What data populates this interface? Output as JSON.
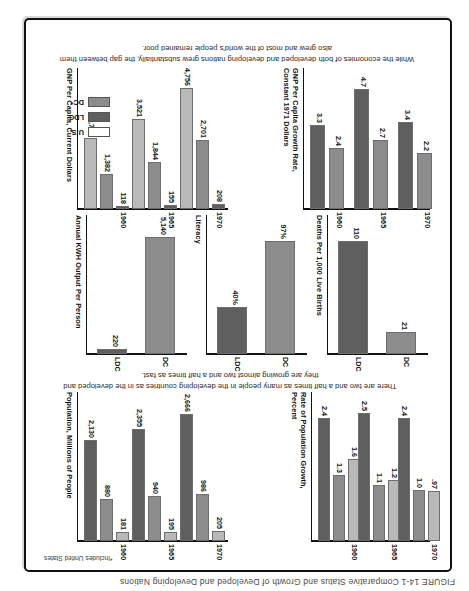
{
  "figure_caption": "FIGURE 14-1   Comparative Status and Growth of Developed and Developing Nations",
  "footnote": "*Includes United States",
  "captions": {
    "middle": "There are two and a half times as many people in the developing countries as in the developed and they are growing almost two and a half times as fast.",
    "bottom": "While the economies of both developed and developing nations grew substantially, the gap between them also grew and most of the world's people remained poor."
  },
  "legend": {
    "items": [
      {
        "label": "U.S.",
        "color": "#ffffff"
      },
      {
        "label": "LDC",
        "color": "#5f5f5f"
      },
      {
        "label": "DC*",
        "color": "#8c8c8c"
      }
    ]
  },
  "colors": {
    "ldc": "#5f5f5f",
    "dc": "#8c8c8c",
    "us": "#b9b9b9",
    "us_open": "#ffffff",
    "axis": "#111111"
  },
  "chart_data": [
    {
      "id": "rate-of-population-growth",
      "type": "bar",
      "title": "Rate of Population Growth, Percent",
      "ylabel": "Rate of Population Growth,\nPercent",
      "categories": [
        "1960",
        "1965",
        "1970"
      ],
      "series": [
        {
          "name": "LDC",
          "values": [
            2.4,
            2.5,
            2.4
          ],
          "labels": [
            "2.4",
            "2.5",
            "2.4"
          ]
        },
        {
          "name": "DC*",
          "values": [
            1.3,
            1.1,
            1.0
          ],
          "labels": [
            "1.3",
            "1.1",
            "1.0"
          ]
        },
        {
          "name": "U.S.",
          "values": [
            1.6,
            1.2,
            0.97
          ],
          "labels": [
            "1.6",
            "1.2",
            ".97"
          ]
        }
      ],
      "ylim": [
        0,
        2.7
      ]
    },
    {
      "id": "population-millions",
      "type": "bar",
      "title": "Population, Millions of People",
      "ylabel": "Population, Millions of People",
      "categories": [
        "1960",
        "1965",
        "1970"
      ],
      "series": [
        {
          "name": "LDC",
          "values": [
            2130,
            2355,
            2666
          ],
          "labels": [
            "2,130",
            "2,355",
            "2,666"
          ]
        },
        {
          "name": "DC*",
          "values": [
            880,
            940,
            986
          ],
          "labels": [
            "880",
            "940",
            "986"
          ]
        },
        {
          "name": "U.S.",
          "values": [
            181,
            195,
            205
          ],
          "labels": [
            "181",
            "195",
            "205"
          ]
        }
      ],
      "ylim": [
        0,
        2900
      ]
    },
    {
      "id": "deaths-per-1000-live-births",
      "type": "bar",
      "title": "Deaths Per 1,000 Live Births",
      "ylabel": "Deaths Per 1,000 Live Births",
      "categories": [
        "LDC",
        "DC"
      ],
      "values": [
        110,
        21
      ],
      "labels": [
        "110",
        "21"
      ],
      "ylim": [
        0,
        125
      ]
    },
    {
      "id": "literacy",
      "type": "bar",
      "title": "Literacy",
      "ylabel": "Literacy",
      "categories": [
        "LDC",
        "DC"
      ],
      "values": [
        40,
        97
      ],
      "labels": [
        "40%",
        "97%"
      ],
      "ylim": [
        0,
        110
      ]
    },
    {
      "id": "annual-kwh-output-per-person",
      "type": "bar",
      "title": "Annual KWH Output Per Person",
      "ylabel": "Annual KWH Output Per Person",
      "categories": [
        "LDC",
        "DC"
      ],
      "values": [
        220,
        5140
      ],
      "labels": [
        "220",
        "5,140"
      ],
      "ylim": [
        0,
        5600
      ]
    },
    {
      "id": "gnp-per-capita-growth-rate",
      "type": "bar",
      "title": "GNP Per Capita Growth Rate, Constant 1971 Dollars",
      "ylabel": "GNP Per Capita Growth Rate,\nConstant 1971 Dollars",
      "categories": [
        "1960",
        "1965",
        "1970"
      ],
      "series": [
        {
          "name": "LDC",
          "values": [
            3.3,
            4.7,
            3.4
          ],
          "labels": [
            "3.3",
            "4.7",
            "3.4"
          ]
        },
        {
          "name": "DC*",
          "values": [
            2.4,
            2.7,
            2.2
          ],
          "labels": [
            "2.4",
            "2.7",
            "2.2"
          ]
        }
      ],
      "ylim": [
        0,
        5.1
      ]
    },
    {
      "id": "gnp-per-capita-current-dollars",
      "type": "bar",
      "title": "GNP Per Capita, Current Dollars",
      "ylabel": "GNP Per Capita, Current Dollars",
      "categories": [
        "1960",
        "1965",
        "1970"
      ],
      "series": [
        {
          "name": "U.S.",
          "values": [
            2788,
            3521,
            4756
          ],
          "labels": [
            "2,788",
            "3,521",
            "4,756"
          ]
        },
        {
          "name": "DC*",
          "values": [
            1382,
            1844,
            2701
          ],
          "labels": [
            "1,382",
            "1,844",
            "2,701"
          ]
        },
        {
          "name": "LDC",
          "values": [
            118,
            155,
            208
          ],
          "labels": [
            "118",
            "155",
            "208"
          ]
        }
      ],
      "ylim": [
        0,
        5100
      ]
    }
  ]
}
